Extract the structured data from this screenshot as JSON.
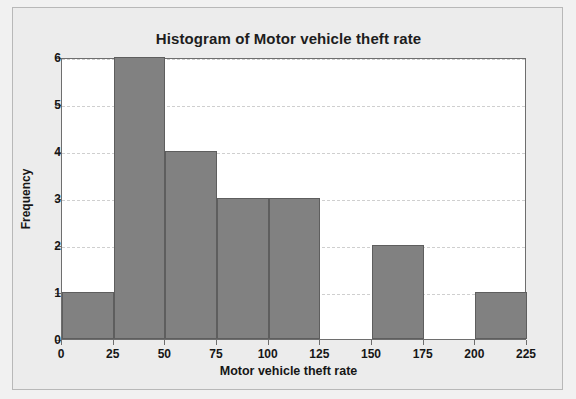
{
  "chart_data": {
    "type": "bar",
    "title": "Histogram of Motor vehicle theft rate",
    "xlabel": "Motor vehicle theft rate",
    "ylabel": "Frequency",
    "xlim": [
      0,
      225
    ],
    "ylim": [
      0,
      6
    ],
    "grid": true,
    "legend": null,
    "bin_width": 25,
    "bin_edges": [
      0,
      25,
      50,
      75,
      100,
      125,
      150,
      175,
      200,
      225
    ],
    "categories": [
      "0-25",
      "25-50",
      "50-75",
      "75-100",
      "100-125",
      "125-150",
      "150-175",
      "175-200",
      "200-225"
    ],
    "values": [
      1,
      6,
      4,
      3,
      3,
      0,
      2,
      0,
      1
    ],
    "xticks": [
      0,
      25,
      50,
      75,
      100,
      125,
      150,
      175,
      200,
      225
    ],
    "xtick_labels": [
      "0",
      "25",
      "50",
      "75",
      "100",
      "125",
      "150",
      "175",
      "200",
      "225"
    ],
    "yticks": [
      0,
      1,
      2,
      3,
      4,
      5,
      6
    ],
    "ytick_labels": [
      "0",
      "1",
      "2",
      "3",
      "4",
      "5",
      "6"
    ],
    "bar_color": "#818181",
    "bar_edge_color": "#5e5e5e",
    "plot_background": "#ffffff",
    "card_background": "#ececec",
    "gridline_color": "#cfcfcf",
    "axis_color": "#6e6e6e",
    "text_color": "#161616"
  }
}
